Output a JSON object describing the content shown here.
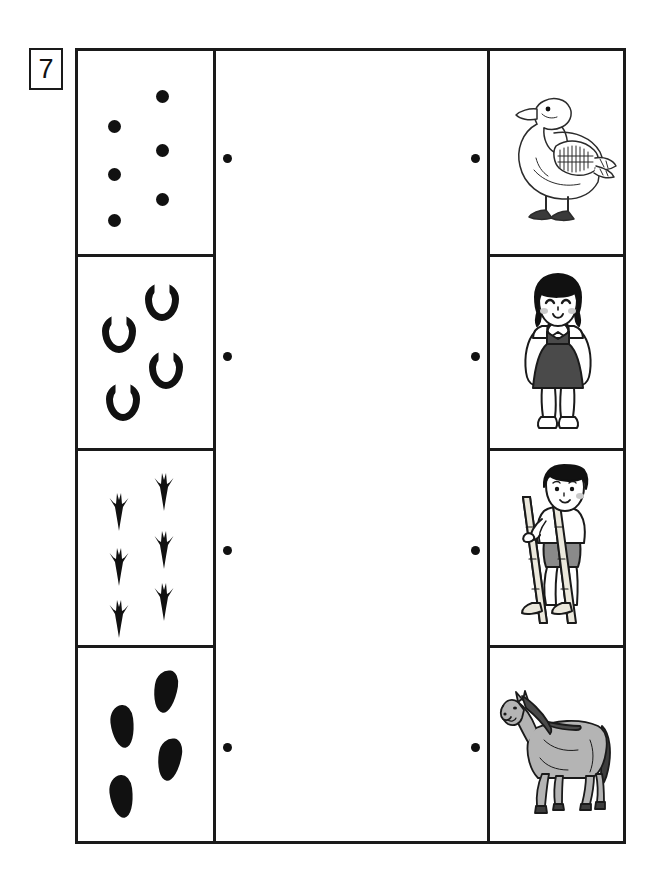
{
  "worksheet": {
    "exercise_number": "7",
    "rows": [
      {
        "id": "row-duck",
        "mark_kind": "round-dot",
        "mark_label": "dot",
        "mark_count": 6,
        "picture_name": "duck",
        "picture_label": "Duck",
        "left_dot_label": "connector-dot-left",
        "right_dot_label": "connector-dot-right"
      },
      {
        "id": "row-girl",
        "mark_kind": "horseshoe",
        "mark_label": "horseshoe",
        "mark_count": 4,
        "picture_name": "girl",
        "picture_label": "Girl in pinafore dress",
        "left_dot_label": "connector-dot-left",
        "right_dot_label": "connector-dot-right"
      },
      {
        "id": "row-boy-stilts",
        "mark_kind": "bird-track",
        "mark_label": "bird footprint",
        "mark_count": 6,
        "picture_name": "boy-on-stilts",
        "picture_label": "Boy walking on stilts",
        "left_dot_label": "connector-dot-left",
        "right_dot_label": "connector-dot-right"
      },
      {
        "id": "row-horse",
        "mark_kind": "shoe-print",
        "mark_label": "shoe print",
        "mark_count": 4,
        "picture_name": "horse",
        "picture_label": "Horse",
        "left_dot_label": "connector-dot-left",
        "right_dot_label": "connector-dot-right"
      }
    ]
  },
  "colors": {
    "ink": "#111111",
    "frame": "#1a1a1a",
    "paper": "#ffffff",
    "horse_body": "#b4b4b4",
    "horse_mane": "#4a4a4a",
    "girl_dress": "#4a4a4a",
    "hair": "#111111",
    "boy_shorts": "#8a8a8a",
    "stilt": "#d8d4c4",
    "cheek": "#c9c9c9"
  }
}
